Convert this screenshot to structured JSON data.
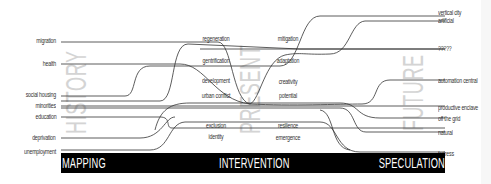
{
  "diagram": {
    "eras": {
      "history": "HISTORY",
      "present": "PRESENT",
      "future": "FUTURE"
    },
    "stages": {
      "mapping": "MAPPING",
      "intervention": "INTERVENTION",
      "speculation": "SPECULATION"
    },
    "left_labels": [
      {
        "label": "migration",
        "y": 41
      },
      {
        "label": "health",
        "y": 63
      },
      {
        "label": "social housing",
        "y": 94
      },
      {
        "label": "minorities",
        "y": 105
      },
      {
        "label": "education",
        "y": 116
      },
      {
        "label": "deprivation",
        "y": 137
      },
      {
        "label": "unemployment",
        "y": 151
      }
    ],
    "middle_labels_left": [
      {
        "label": "regeneration",
        "y": 38
      },
      {
        "label": "gentrification",
        "y": 60
      },
      {
        "label": "development",
        "y": 80
      },
      {
        "label": "urban conflict",
        "y": 95
      },
      {
        "label": "exclusion",
        "y": 125
      },
      {
        "label": "identity",
        "y": 136
      }
    ],
    "middle_labels_right": [
      {
        "label": "mitigation",
        "y": 38
      },
      {
        "label": "adaptation",
        "y": 60
      },
      {
        "label": "creativity",
        "y": 81
      },
      {
        "label": "potential",
        "y": 95
      },
      {
        "label": "resilience",
        "y": 125
      },
      {
        "label": "emergence",
        "y": 137
      }
    ],
    "right_labels": [
      {
        "label": "vertical city",
        "y": 13
      },
      {
        "label": "artificial",
        "y": 21
      },
      {
        "label": "?????",
        "y": 48
      },
      {
        "label": "automation central",
        "y": 80
      },
      {
        "label": "productive enclave",
        "y": 107
      },
      {
        "label": "off the grid",
        "y": 118
      },
      {
        "label": "natural",
        "y": 132
      },
      {
        "label": "fortress",
        "y": 153
      }
    ],
    "colors": {
      "line": "#333333",
      "era_text": "#d4d4d4",
      "bar": "#000000",
      "bar_text": "#ffffff"
    }
  }
}
